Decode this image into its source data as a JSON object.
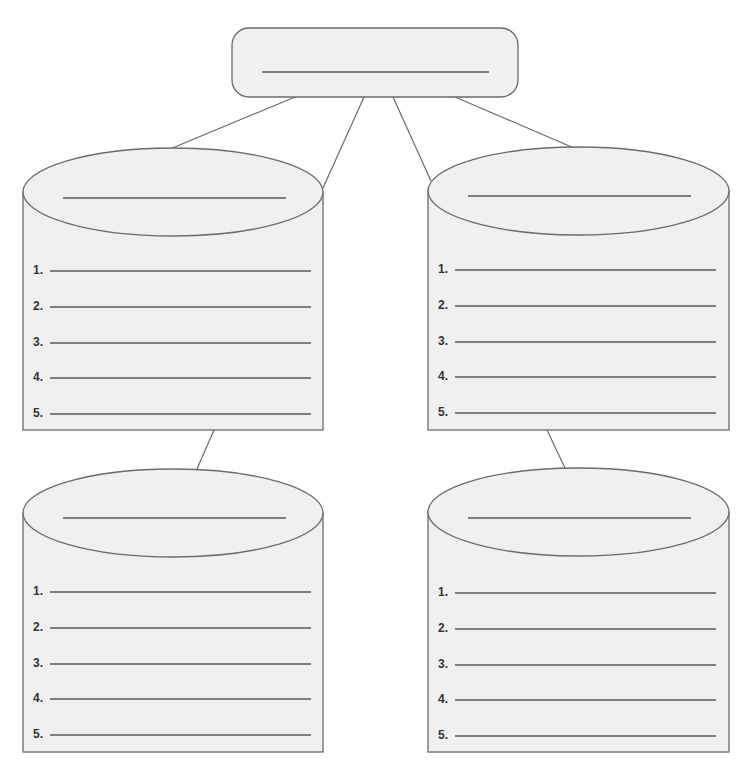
{
  "diagram": {
    "type": "hierarchy-graphic-organizer",
    "colors": {
      "fill": "#f0f0f0",
      "stroke": "#6b6b6b",
      "line": "#5a5a5a",
      "text": "#333333"
    },
    "top_box": {
      "label": ""
    },
    "cylinders": [
      {
        "position": "top-left",
        "title": "",
        "items": [
          {
            "num": "1.",
            "text": ""
          },
          {
            "num": "2.",
            "text": ""
          },
          {
            "num": "3.",
            "text": ""
          },
          {
            "num": "4.",
            "text": ""
          },
          {
            "num": "5.",
            "text": ""
          }
        ]
      },
      {
        "position": "top-right",
        "title": "",
        "items": [
          {
            "num": "1.",
            "text": ""
          },
          {
            "num": "2.",
            "text": ""
          },
          {
            "num": "3.",
            "text": ""
          },
          {
            "num": "4.",
            "text": ""
          },
          {
            "num": "5.",
            "text": ""
          }
        ]
      },
      {
        "position": "bottom-left",
        "title": "",
        "items": [
          {
            "num": "1.",
            "text": ""
          },
          {
            "num": "2.",
            "text": ""
          },
          {
            "num": "3.",
            "text": ""
          },
          {
            "num": "4.",
            "text": ""
          },
          {
            "num": "5.",
            "text": ""
          }
        ]
      },
      {
        "position": "bottom-right",
        "title": "",
        "items": [
          {
            "num": "1.",
            "text": ""
          },
          {
            "num": "2.",
            "text": ""
          },
          {
            "num": "3.",
            "text": ""
          },
          {
            "num": "4.",
            "text": ""
          },
          {
            "num": "5.",
            "text": ""
          }
        ]
      }
    ]
  }
}
